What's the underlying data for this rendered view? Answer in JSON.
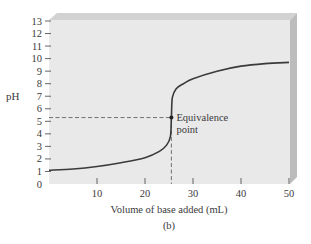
{
  "chart_data": {
    "type": "line",
    "title": "",
    "subtitle": "(b)",
    "xlabel": "Volume of base added (mL)",
    "ylabel": "pH",
    "xlim": [
      0,
      50
    ],
    "ylim": [
      0,
      13
    ],
    "x_ticks": [
      10,
      20,
      30,
      40,
      50
    ],
    "y_ticks": [
      0,
      1,
      2,
      3,
      4,
      5,
      6,
      7,
      8,
      9,
      10,
      11,
      12,
      13
    ],
    "grid": false,
    "legend": null,
    "series": [
      {
        "name": "Titration curve",
        "x": [
          0,
          5,
          10,
          15,
          20,
          23,
          24.5,
          25.3,
          25.5,
          25.7,
          26.5,
          28,
          30,
          35,
          40,
          45,
          50
        ],
        "values": [
          1.1,
          1.2,
          1.4,
          1.7,
          2.1,
          2.6,
          3.1,
          3.8,
          5.3,
          6.9,
          7.6,
          8.0,
          8.4,
          9.0,
          9.4,
          9.6,
          9.7
        ]
      }
    ],
    "annotations": [
      {
        "text_lines": [
          "Equivalence",
          "point"
        ],
        "x": 25.5,
        "y": 5.3,
        "guide_lines": "dashed lines to both axes"
      }
    ],
    "style": {
      "plot_background": "#e9e9e9",
      "bevel_top": "#cfcfcf",
      "bevel_right": "#bdbdbd",
      "curve_color": "#3a3a3a",
      "dash_color": "#555555"
    }
  }
}
